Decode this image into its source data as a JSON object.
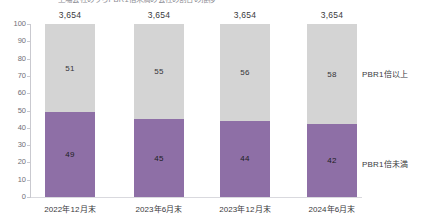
{
  "chart_data": {
    "type": "bar",
    "title": "上場会社のうちPBR1倍未満の会社の割合の推移",
    "subtitle": "",
    "xlabel": "",
    "ylabel": "",
    "ylim": [
      0,
      100
    ],
    "ytick_labels": [
      "100",
      "90",
      "80",
      "70",
      "60",
      "50",
      "40",
      "30",
      "20",
      "10",
      "0"
    ],
    "ytick_values": [
      100,
      90,
      80,
      70,
      60,
      50,
      40,
      30,
      20,
      10,
      0
    ],
    "grid": false,
    "stacked": true,
    "legend_position": "right-inline",
    "categories": [
      "2022年12月末",
      "2023年6月末",
      "2023年12月末",
      "2024年6月末"
    ],
    "totals": [
      "3,654",
      "3,654",
      "3,654",
      "3,654"
    ],
    "series": [
      {
        "name": "PBR1倍以上",
        "color": "#d4d4d4",
        "values": [
          51,
          55,
          56,
          58
        ]
      },
      {
        "name": "PBR1倍未満",
        "color": "#8e6fa6",
        "values": [
          49,
          45,
          44,
          42
        ]
      }
    ]
  },
  "colors": {
    "upper_segment": "#d4d4d4",
    "lower_segment": "#8e6fa6",
    "axis": "#c9c9cf",
    "text": "#3a3a40",
    "background": "#ffffff"
  }
}
